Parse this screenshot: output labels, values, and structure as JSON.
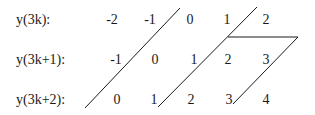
{
  "diagram": {
    "rows": [
      {
        "label": "y(3k):",
        "values": [
          "-2",
          "-1",
          "0",
          "1",
          "2"
        ]
      },
      {
        "label": "y(3k+1):",
        "values": [
          "-1",
          "0",
          "1",
          "2",
          "3"
        ]
      },
      {
        "label": "y(3k+2):",
        "values": [
          "0",
          "1",
          "2",
          "3",
          "4"
        ]
      }
    ],
    "line_color": "#1a1a1a"
  }
}
